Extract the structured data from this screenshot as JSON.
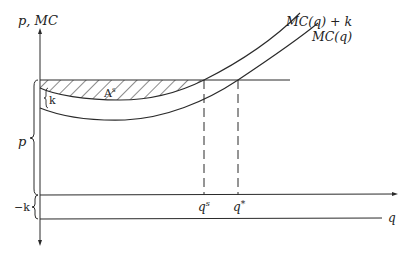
{
  "figure": {
    "type": "economics-diagram",
    "colors": {
      "ink": "#2a2a2a",
      "background": "#ffffff"
    }
  },
  "axes": {
    "y_label": "p, MC",
    "x_label": "q"
  },
  "curves": [
    {
      "name": "upper-cost-curve",
      "label": "MC(q) + k"
    },
    {
      "name": "marginal-cost-curve",
      "label": "MC(q)"
    }
  ],
  "annotations": {
    "shaded_area": "A",
    "shaded_area_sup": "s",
    "gap_k": "k",
    "price_brace": "p",
    "neg_k_brace": "−k",
    "q_s": "q",
    "q_s_sup": "s",
    "q_star": "q",
    "q_star_sup": "*"
  }
}
